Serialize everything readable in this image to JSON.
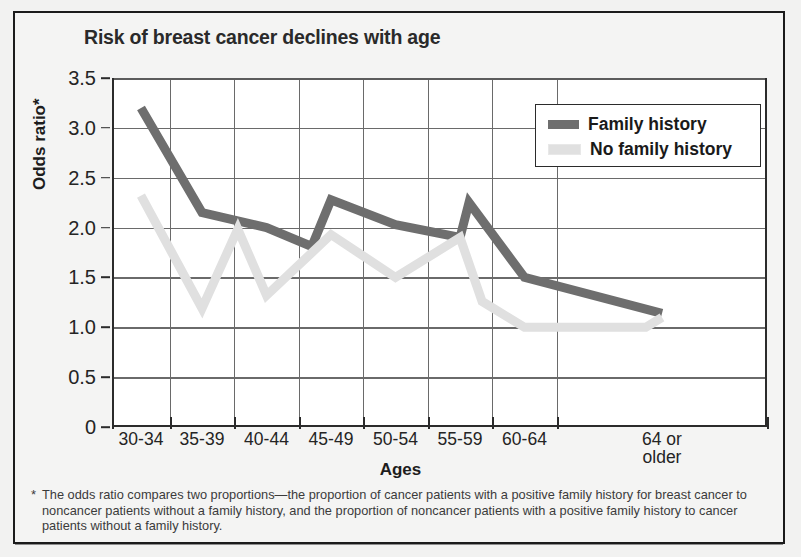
{
  "chart_data": {
    "type": "line",
    "title": "Risk of breast cancer declines with age",
    "xlabel": "Ages",
    "ylabel": "Odds ratio*",
    "categories": [
      "30-34",
      "35-39",
      "40-44",
      "45-49",
      "50-54",
      "55-59",
      "60-64",
      "64 or\nolder"
    ],
    "category_labels": [
      "30-34",
      "35-39",
      "40-44",
      "45-49",
      "50-54",
      "55-59",
      "60-64",
      "64 or older"
    ],
    "ylim": [
      0,
      3.5
    ],
    "yticks": [
      "0",
      "0.5",
      "1.0",
      "1.5",
      "2.0",
      "2.5",
      "3.0",
      "3.5"
    ],
    "ytick_values": [
      0,
      0.5,
      1.0,
      1.5,
      2.0,
      2.5,
      3.0,
      3.5
    ],
    "grid": "both",
    "legend_position": "top-right",
    "series": [
      {
        "name": "Family history",
        "color": "#6e6e6e",
        "values": [
          3.2,
          2.15,
          2.0,
          2.28,
          2.03,
          1.9,
          1.5,
          1.14
        ],
        "interior_vertices": [
          {
            "x_frac": 0.305,
            "value": 1.81
          },
          {
            "x_frac": 0.545,
            "value": 2.25
          }
        ]
      },
      {
        "name": "No family history",
        "color": "#e0e0e0",
        "values": [
          2.32,
          1.19,
          1.32,
          1.93,
          1.5,
          1.9,
          1.0,
          1.1
        ],
        "interior_vertices": [
          {
            "x_frac": 0.192,
            "value": 1.985
          },
          {
            "x_frac": 0.565,
            "value": 1.26
          },
          {
            "x_frac": 0.815,
            "value": 1.0
          }
        ]
      }
    ]
  },
  "legend": {
    "items": [
      {
        "label": "Family history",
        "color": "#6e6e6e"
      },
      {
        "label": "No family history",
        "color": "#e0e0e0"
      }
    ]
  },
  "footnote": {
    "marker": "*",
    "text": "The odds ratio compares two proportions—the proportion of cancer patients with a positive family history for breast cancer to noncancer patients without a family history, and the proportion of noncancer patients with a positive family history to cancer patients without a family history."
  }
}
